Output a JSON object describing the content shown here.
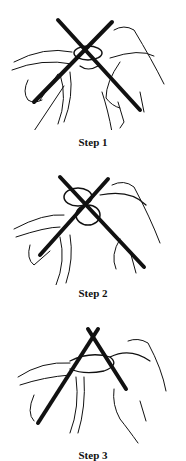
{
  "steps": [
    {
      "label": "Step 1",
      "illustration": "knitting-needles-crossed-loop-icon"
    },
    {
      "label": "Step 2",
      "illustration": "knitting-needles-wrap-yarn-icon"
    },
    {
      "label": "Step 3",
      "illustration": "knitting-needles-pull-through-icon"
    }
  ]
}
